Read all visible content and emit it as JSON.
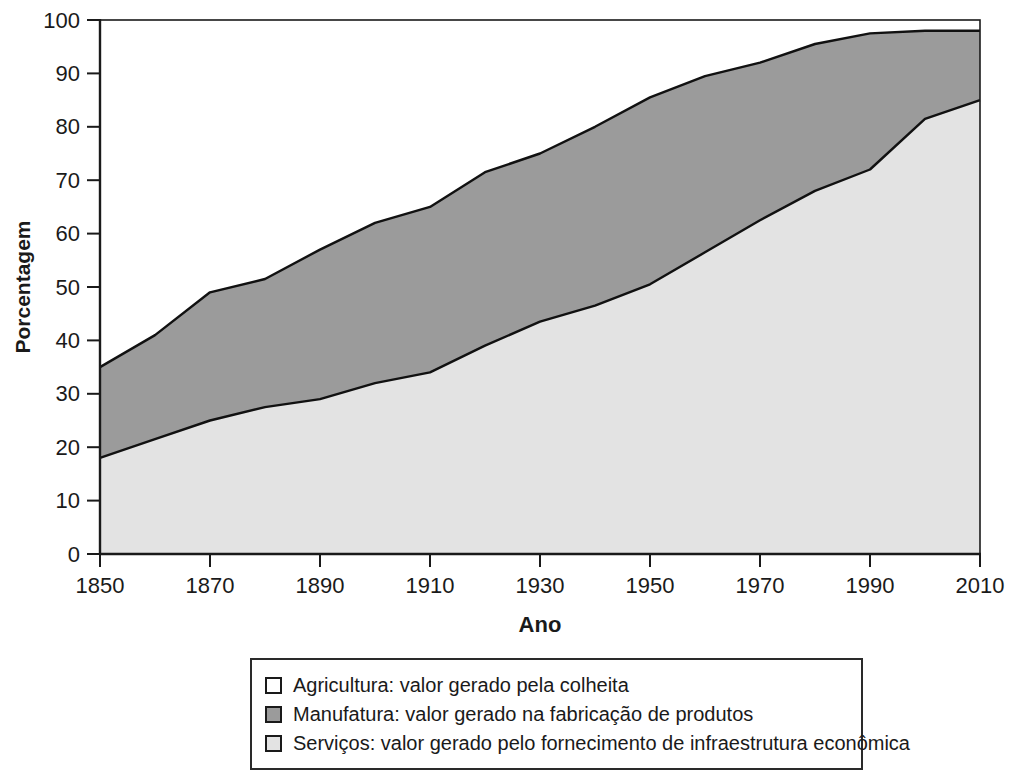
{
  "chart_data": {
    "type": "area",
    "stacked": true,
    "title": "",
    "xlabel": "Ano",
    "ylabel": "Porcentagem",
    "ylim": [
      0,
      100
    ],
    "xlim": [
      1850,
      2010
    ],
    "grid": false,
    "x": [
      1850,
      1860,
      1870,
      1880,
      1890,
      1900,
      1910,
      1920,
      1930,
      1940,
      1950,
      1960,
      1970,
      1980,
      1990,
      2000,
      2010
    ],
    "x_ticks": [
      1850,
      1870,
      1890,
      1910,
      1930,
      1950,
      1970,
      1990,
      2010
    ],
    "y_ticks": [
      0,
      10,
      20,
      30,
      40,
      50,
      60,
      70,
      80,
      90,
      100
    ],
    "series": [
      {
        "name": "Serviços",
        "color": "#e3e3e3",
        "values": [
          18,
          21.5,
          25,
          27.5,
          29,
          32,
          34,
          39,
          43.5,
          46.5,
          50.5,
          56.5,
          62.5,
          68,
          72,
          81.5,
          85
        ]
      },
      {
        "name": "Manufatura",
        "color": "#9b9b9b",
        "values": [
          17,
          19.5,
          24,
          24,
          28,
          30,
          31,
          32.5,
          31.5,
          33.5,
          35,
          33,
          29.5,
          27.5,
          25.5,
          16.5,
          13
        ]
      },
      {
        "name": "Agricultura",
        "color": "#ffffff",
        "values": [
          65,
          59,
          51,
          48.5,
          43,
          38,
          35,
          28.5,
          25,
          20,
          14.5,
          10.5,
          8,
          4.5,
          2.5,
          2,
          2
        ]
      }
    ],
    "line_color": "#111111",
    "frame_color": "#1a1a1a",
    "legend_position": "bottom"
  },
  "legend": {
    "items": [
      {
        "label": "Agricultura: valor gerado pela colheita",
        "color": "#ffffff"
      },
      {
        "label": "Manufatura: valor gerado na fabricação de produtos",
        "color": "#9b9b9b"
      },
      {
        "label": "Serviços: valor gerado pelo fornecimento de infraestrutura econômica",
        "color": "#e3e3e3"
      }
    ]
  }
}
